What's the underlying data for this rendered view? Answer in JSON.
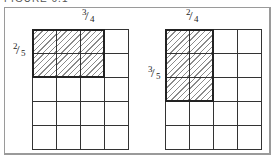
{
  "caption": "FIGURE 6.1",
  "diagrams": [
    {
      "id": "left",
      "cols": 4,
      "rows": 5,
      "shaded_cols": 3,
      "shaded_rows": 2,
      "top_label": {
        "num": "3",
        "den": "4"
      },
      "side_label": {
        "num": "2",
        "den": "5"
      }
    },
    {
      "id": "right",
      "cols": 4,
      "rows": 5,
      "shaded_cols": 2,
      "shaded_rows": 3,
      "top_label": {
        "num": "2",
        "den": "4"
      },
      "side_label": {
        "num": "3",
        "den": "5"
      }
    }
  ],
  "colors": {
    "grid_line": "#333333",
    "hatch": "#8a8a8a",
    "frame": "#9a9a9a"
  }
}
